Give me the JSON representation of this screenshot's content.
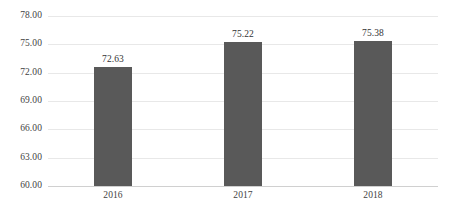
{
  "chart_data": {
    "type": "bar",
    "title": "",
    "subtitle": "",
    "xlabel": "",
    "ylabel": "",
    "categories": [
      "2016",
      "2017",
      "2018"
    ],
    "values": [
      72.63,
      75.22,
      75.38
    ],
    "value_labels": [
      "72.63",
      "75.22",
      "75.38"
    ],
    "series": [
      {
        "name": "",
        "values": [
          72.63,
          75.22,
          75.38
        ]
      }
    ],
    "ylim": [
      60.0,
      78.0
    ],
    "ytick_values": [
      78.0,
      75.0,
      72.0,
      69.0,
      66.0,
      63.0,
      60.0
    ],
    "ytick_labels": [
      "78.00",
      "75.00",
      "72.00",
      "69.00",
      "66.00",
      "63.00",
      "60.00"
    ],
    "grid": true,
    "grid_axis": "y",
    "legend": false,
    "legend_position": "none",
    "annotations": [],
    "colors": {
      "bar_fill": "#595959",
      "gridline": "#e8e8e8",
      "axis_line": "#d0d0d0",
      "tick_label_text": "#3f3f3f",
      "value_label_text": "#333333",
      "background": "#ffffff"
    }
  }
}
